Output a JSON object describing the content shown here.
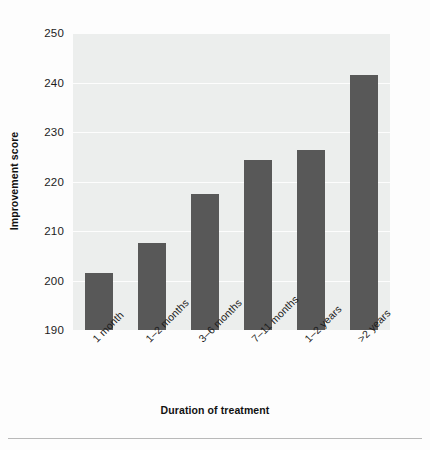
{
  "chart_data": {
    "type": "bar",
    "title": "",
    "subtitle": "",
    "xlabel": "Duration of treatment",
    "ylabel": "Improvement score",
    "categories": [
      "1 month",
      "1–2 months",
      "3–6 months",
      "7–11 months",
      "1–2 years",
      ">2 years"
    ],
    "values": [
      201.5,
      207.5,
      217.4,
      224.3,
      226.4,
      241.5
    ],
    "ylim": [
      190,
      250
    ],
    "yticks": [
      190,
      200,
      210,
      220,
      230,
      240,
      250
    ],
    "ytick_labels": [
      "190",
      "200",
      "210",
      "220",
      "230",
      "240",
      "250"
    ],
    "grid": true,
    "grid_axis": "y",
    "legend": false,
    "legend_position": "none",
    "bar_color": "#585858",
    "plot_background": "#eceeed",
    "gridline_color": "#fdfdfd",
    "figure_background": "#fdfdfd",
    "xtick_label_rotation": -45
  },
  "axes": {
    "y_title": "Improvement score",
    "x_title": "Duration of treatment"
  }
}
